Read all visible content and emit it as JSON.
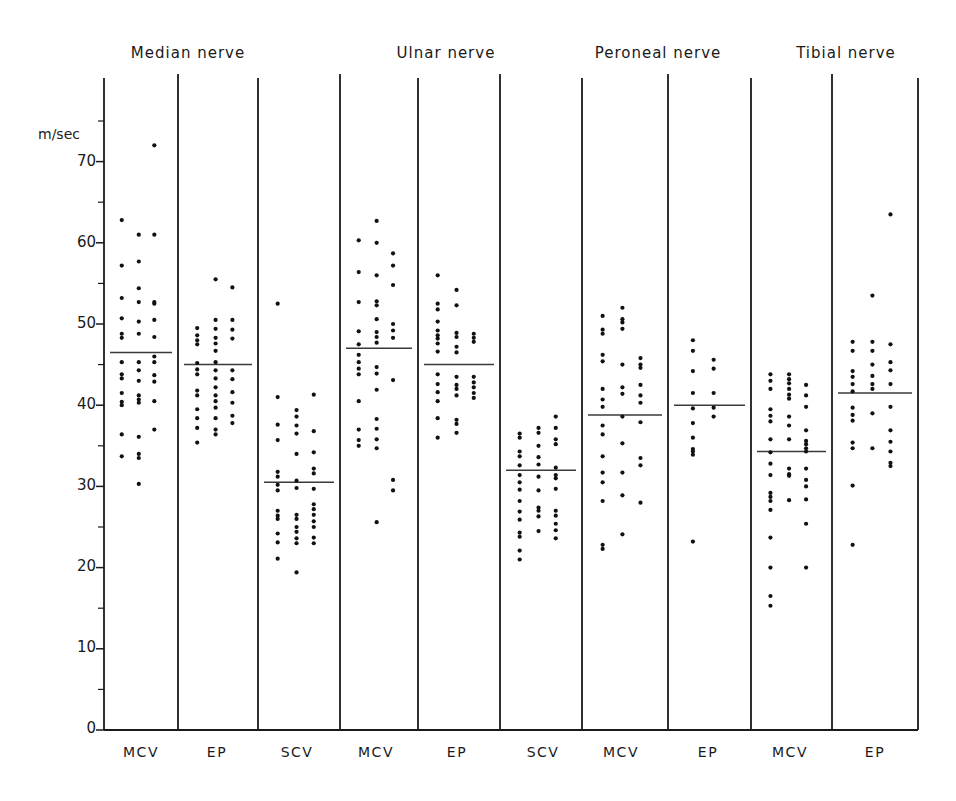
{
  "chart_data": {
    "type": "scatter",
    "title": "",
    "ylabel": "m/sec",
    "xlabel": "",
    "ylim": [
      0,
      75
    ],
    "yticks": [
      0,
      10,
      20,
      30,
      40,
      50,
      60,
      70
    ],
    "yminor_ticks": [
      5,
      15,
      25,
      35,
      45,
      55,
      65,
      75
    ],
    "grid": false,
    "legend": null,
    "groups": [
      {
        "name": "Median nerve",
        "categories": [
          "MCV",
          "EP",
          "SCV"
        ]
      },
      {
        "name": "Ulnar nerve",
        "categories": [
          "MCV",
          "EP",
          "SCV"
        ]
      },
      {
        "name": "Peroneal nerve",
        "categories": [
          "MCV",
          "EP"
        ]
      },
      {
        "name": "Tibial nerve",
        "categories": [
          "MCV",
          "EP"
        ]
      }
    ],
    "categories": [
      "MCV",
      "EP",
      "SCV",
      "MCV",
      "EP",
      "SCV",
      "MCV",
      "EP",
      "MCV",
      "EP"
    ],
    "panels": [
      {
        "group": "Median nerve",
        "category": "MCV",
        "mean": 46.5,
        "columns": [
          [
            62.8,
            57.2,
            53.2,
            50.7,
            48.8,
            48.3,
            45.3,
            43.8,
            43.3,
            41.5,
            40.4,
            40.0,
            36.4,
            33.7
          ],
          [
            61.0,
            57.7,
            54.4,
            52.7,
            50.3,
            48.8,
            45.3,
            44.3,
            43.0,
            41.2,
            40.7,
            40.3,
            36.1,
            34.0,
            33.5,
            30.3
          ],
          [
            72.0,
            61.0,
            52.7,
            52.5,
            50.5,
            48.4,
            46.0,
            45.3,
            43.7,
            42.9,
            40.5,
            37.0
          ]
        ]
      },
      {
        "group": "Median nerve",
        "category": "EP",
        "mean": 45,
        "columns": [
          [
            49.5,
            48.6,
            48.0,
            47.5,
            45.2,
            44.4,
            43.8,
            41.8,
            41.2,
            39.5,
            38.4,
            37.2,
            35.4
          ],
          [
            55.5,
            50.5,
            49.4,
            48.3,
            47.6,
            46.7,
            45.3,
            44.3,
            43.3,
            42.2,
            41.2,
            40.5,
            39.7,
            38.4,
            37.0,
            36.4
          ],
          [
            54.5,
            50.5,
            49.3,
            48.2,
            44.3,
            43.2,
            41.6,
            40.3,
            38.7,
            37.8
          ]
        ]
      },
      {
        "group": "Median nerve",
        "category": "SCV",
        "mean": 30.5,
        "columns": [
          [
            52.5,
            41.0,
            37.6,
            35.7,
            31.8,
            31.2,
            30.2,
            29.5,
            27.0,
            26.4,
            26.0,
            24.2,
            23.1,
            21.1
          ],
          [
            39.4,
            38.6,
            37.5,
            36.5,
            34.0,
            30.7,
            29.8,
            26.5,
            26.0,
            25.0,
            24.4,
            23.6,
            23.0,
            19.4
          ],
          [
            41.3,
            36.8,
            34.2,
            32.2,
            31.6,
            29.7,
            27.8,
            27.2,
            26.5,
            25.7,
            25.0,
            23.7,
            23.0
          ]
        ]
      },
      {
        "group": "Ulnar nerve",
        "category": "MCV",
        "mean": 47,
        "columns": [
          [
            60.3,
            56.4,
            52.7,
            49.1,
            47.5,
            46.2,
            45.3,
            44.5,
            43.8,
            40.5,
            37.0,
            35.7,
            35.0
          ],
          [
            62.7,
            60.0,
            56.0,
            52.8,
            52.3,
            50.6,
            49.0,
            48.4,
            47.7,
            44.7,
            43.9,
            41.9,
            38.3,
            37.1,
            35.8,
            34.7,
            25.6
          ],
          [
            58.7,
            57.2,
            54.8,
            50.0,
            49.2,
            48.3,
            43.1,
            29.5,
            30.8
          ]
        ]
      },
      {
        "group": "Ulnar nerve",
        "category": "EP",
        "mean": 45,
        "columns": [
          [
            56.0,
            52.5,
            51.8,
            50.3,
            49.2,
            48.6,
            48.2,
            47.6,
            46.6,
            43.8,
            42.6,
            41.6,
            40.5,
            38.4,
            36.0
          ],
          [
            54.2,
            52.3,
            48.9,
            48.4,
            47.2,
            46.5,
            43.5,
            42.5,
            42.0,
            41.2,
            38.2,
            37.7,
            36.6
          ],
          [
            48.8,
            48.3,
            47.8,
            43.5,
            42.8,
            42.2,
            41.5,
            40.9
          ]
        ]
      },
      {
        "group": "Ulnar nerve",
        "category": "SCV",
        "mean": 32,
        "columns": [
          [
            36.5,
            36.0,
            34.3,
            33.7,
            32.6,
            31.4,
            30.5,
            29.6,
            28.2,
            26.9,
            25.9,
            24.3,
            23.8,
            22.1,
            21.0
          ],
          [
            37.2,
            36.6,
            35.0,
            33.6,
            32.7,
            31.2,
            29.5,
            27.4,
            27.0,
            26.3,
            24.5
          ],
          [
            38.6,
            37.2,
            35.8,
            35.2,
            32.3,
            31.4,
            31.0,
            29.7,
            27.0,
            26.4,
            25.4,
            24.6,
            23.6
          ]
        ]
      },
      {
        "group": "Peroneal nerve",
        "category": "MCV",
        "mean": 38.8,
        "columns": [
          [
            51.0,
            49.3,
            48.8,
            46.2,
            45.4,
            42.0,
            40.7,
            39.8,
            37.5,
            36.4,
            33.7,
            31.7,
            30.5,
            28.2,
            22.8,
            22.3
          ],
          [
            52.0,
            50.6,
            50.2,
            49.4,
            45.0,
            42.2,
            41.4,
            38.6,
            35.3,
            31.7,
            28.9,
            24.1
          ],
          [
            45.8,
            45.0,
            44.6,
            42.5,
            41.2,
            40.3,
            37.9,
            33.5,
            32.6,
            28.0
          ]
        ]
      },
      {
        "group": "Peroneal nerve",
        "category": "EP",
        "mean": 40,
        "columns": [
          [
            48.0,
            46.7,
            44.2,
            41.5,
            39.6,
            37.8,
            36.0,
            34.6,
            34.3,
            33.9,
            23.2
          ],
          [
            45.6,
            44.5,
            41.5,
            39.7,
            38.6
          ]
        ]
      },
      {
        "group": "Tibial nerve",
        "category": "MCV",
        "mean": 34.3,
        "columns": [
          [
            43.8,
            43.0,
            42.0,
            39.5,
            38.7,
            38.0,
            35.8,
            34.2,
            32.8,
            31.4,
            29.2,
            28.7,
            28.2,
            27.1,
            23.7,
            20.0,
            16.5,
            15.3
          ],
          [
            43.8,
            43.2,
            42.7,
            42.0,
            41.3,
            40.8,
            38.6,
            37.5,
            35.8,
            32.2,
            31.5,
            31.3,
            28.3
          ],
          [
            42.5,
            41.2,
            39.8,
            36.9,
            35.6,
            35.2,
            34.7,
            34.3,
            32.2,
            30.8,
            30.0,
            28.4,
            25.4,
            20.0
          ]
        ]
      },
      {
        "group": "Tibial nerve",
        "category": "EP",
        "mean": 41.5,
        "columns": [
          [
            47.8,
            46.7,
            44.2,
            43.5,
            42.6,
            41.7,
            39.7,
            38.8,
            38.1,
            35.4,
            34.7,
            30.1,
            22.8
          ],
          [
            53.5,
            47.8,
            46.7,
            45.0,
            43.6,
            42.6,
            42.0,
            39.0,
            34.7
          ],
          [
            63.5,
            47.5,
            45.3,
            44.3,
            42.6,
            39.8,
            36.9,
            35.5,
            34.3,
            32.9,
            32.5
          ]
        ]
      }
    ]
  },
  "y_axis": {
    "unit_label": "m/sec",
    "tick_labels": [
      "0",
      "10",
      "20",
      "30",
      "40",
      "50",
      "60",
      "70"
    ]
  },
  "group_titles": [
    "Median nerve",
    "Ulnar nerve",
    "Peroneal nerve",
    "Tibial nerve"
  ],
  "category_labels": [
    "MCV",
    "EP",
    "SCV",
    "MCV",
    "EP",
    "SCV",
    "MCV",
    "EP",
    "MCV",
    "EP"
  ]
}
